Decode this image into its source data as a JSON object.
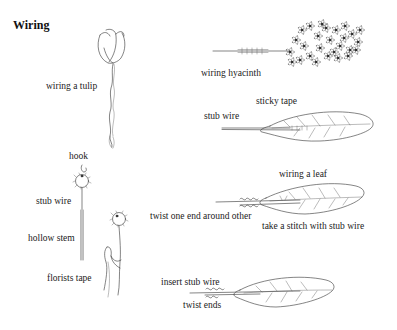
{
  "title": "Wiring",
  "illustrations": [
    {
      "id": "tulip",
      "labels": [
        "wiring a tulip"
      ]
    },
    {
      "id": "hyacinth",
      "labels": [
        "wiring hyacinth"
      ]
    },
    {
      "id": "leaf-tape",
      "labels": [
        "sticky tape",
        "stub wire"
      ]
    },
    {
      "id": "flower-hook",
      "labels": [
        "hook",
        "stub wire",
        "hollow stem",
        "florists tape"
      ]
    },
    {
      "id": "leaf-stitch",
      "labels": [
        "wiring a leaf",
        "twist one end around other",
        "take a stitch with stub wire"
      ]
    },
    {
      "id": "leaf-insert",
      "labels": [
        "insert stub wire",
        "twist ends"
      ]
    }
  ],
  "colors": {
    "background": "#ffffff",
    "ink": "#222222"
  }
}
